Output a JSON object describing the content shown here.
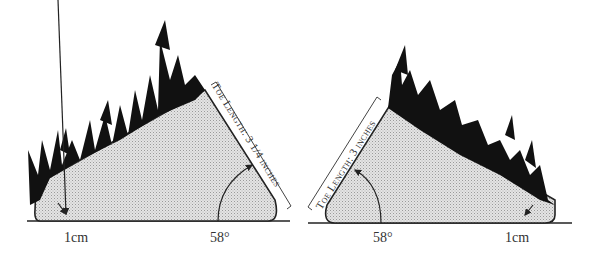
{
  "diagrams": [
    {
      "id": "left",
      "toe_length_label": "Toe Length:  3 1/4 inches",
      "angle_label": "58°",
      "heel_label": "1cm"
    },
    {
      "id": "right",
      "toe_length_label": "Toe Length:  3 inches",
      "angle_label": "58°",
      "heel_label": "1cm"
    }
  ],
  "colors": {
    "hoof_fill": "#d9d9d9",
    "hair": "#111111",
    "line": "#222222"
  }
}
